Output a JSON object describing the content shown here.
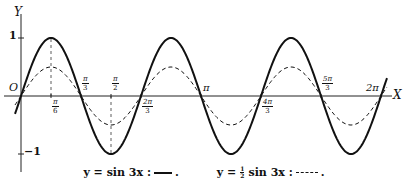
{
  "chart_data": {
    "type": "line",
    "title": "",
    "xlabel": "X",
    "ylabel": "Y",
    "origin_label": "O",
    "xlim": [
      0,
      6.2832
    ],
    "ylim": [
      -1,
      1
    ],
    "grid": false,
    "x_tick_labels": [
      {
        "label_num": "π",
        "label_den": "6",
        "value": 0.5236,
        "position": "below"
      },
      {
        "label_num": "π",
        "label_den": "3",
        "value": 1.0472,
        "position": "above"
      },
      {
        "label_num": "π",
        "label_den": "2",
        "value": 1.5708,
        "position": "above"
      },
      {
        "label_num": "2π",
        "label_den": "3",
        "value": 2.0944,
        "position": "below"
      },
      {
        "label_num": "π",
        "label_den": "",
        "value": 3.1416,
        "position": "above"
      },
      {
        "label_num": "4π",
        "label_den": "3",
        "value": 4.1888,
        "position": "below"
      },
      {
        "label_num": "5π",
        "label_den": "3",
        "value": 5.236,
        "position": "above"
      },
      {
        "label_num": "2π",
        "label_den": "",
        "value": 6.2832,
        "position": "above"
      }
    ],
    "y_tick_labels": [
      {
        "label": "1",
        "value": 1
      },
      {
        "label": "−1",
        "value": -1
      }
    ],
    "series": [
      {
        "name": "y = sin 3x",
        "style": "solid",
        "function": "sin(3x)",
        "amplitude": 1,
        "frequency": 3,
        "key_points": [
          [
            0,
            0
          ],
          [
            0.5236,
            1
          ],
          [
            1.0472,
            0
          ],
          [
            1.5708,
            -1
          ],
          [
            2.0944,
            0
          ],
          [
            2.618,
            1
          ],
          [
            3.1416,
            0
          ],
          [
            3.6652,
            -1
          ],
          [
            4.1888,
            0
          ],
          [
            4.7124,
            1
          ],
          [
            5.236,
            0
          ],
          [
            5.7596,
            -1
          ],
          [
            6.2832,
            0
          ]
        ]
      },
      {
        "name": "y = ½ sin 3x",
        "style": "dashed",
        "function": "0.5*sin(3x)",
        "amplitude": 0.5,
        "frequency": 3,
        "key_points": [
          [
            0,
            0
          ],
          [
            0.5236,
            0.5
          ],
          [
            1.0472,
            0
          ],
          [
            1.5708,
            -0.5
          ],
          [
            2.0944,
            0
          ],
          [
            2.618,
            0.5
          ],
          [
            3.1416,
            0
          ],
          [
            3.6652,
            -0.5
          ],
          [
            4.1888,
            0
          ],
          [
            4.7124,
            0.5
          ],
          [
            5.236,
            0
          ],
          [
            5.7596,
            -0.5
          ],
          [
            6.2832,
            0
          ]
        ]
      }
    ],
    "reference_lines": [
      {
        "x": 0.5236,
        "style": "dashed",
        "from": 0,
        "to": 1
      },
      {
        "x": 1.5708,
        "style": "dashed",
        "from": 0,
        "to": -1
      }
    ],
    "legend": [
      {
        "prefix": "y = sin 3x :",
        "style": "solid",
        "suffix": "."
      },
      {
        "prefix_a": "y =",
        "frac_num": "1",
        "frac_den": "2",
        "prefix_b": "sin 3x :",
        "style": "dashed",
        "suffix": "."
      }
    ]
  },
  "colors": {
    "ink": "#111111",
    "background": "#ffffff"
  }
}
